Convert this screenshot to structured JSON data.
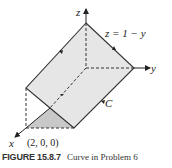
{
  "figure": {
    "axes": {
      "x_label": "x",
      "y_label": "y",
      "z_label": "z"
    },
    "plane_equation": "z = 1 − y",
    "point_label": "(2, 0, 0)",
    "curve_label": "C",
    "colors": {
      "plane_fill": "#e6e6e6",
      "triangle_fill": "#c8c8c8",
      "edge": "#333333"
    }
  },
  "caption": {
    "number": "FIGURE 15.8.7",
    "text": "Curve in Problem 6"
  }
}
